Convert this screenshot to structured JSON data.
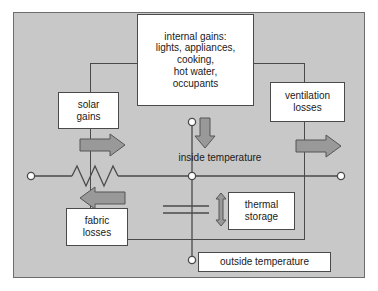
{
  "diagram": {
    "colors": {
      "frame_fill": "#c8c8c8",
      "frame_border": "#6d6d6d",
      "box_fill": "#ffffff",
      "box_border": "#4a4a4a",
      "wire": "#4a4a4a",
      "arrow_fill": "#999999",
      "arrow_border": "#555555",
      "text": "#1a1a1a"
    },
    "boxes": {
      "internal_gains": "internal gains:\nlights, appliances,\ncooking,\nhot water,\noccupants",
      "solar_gains": "solar\ngains",
      "ventilation_losses": "ventilation\nlosses",
      "fabric_losses": "fabric\nlosses",
      "thermal_storage": "thermal\nstorage",
      "outside_temperature": "outside temperature"
    },
    "labels": {
      "inside_temperature": "inside temperature"
    },
    "symbols": {
      "resistor": "resistor-zigzag",
      "capacitor": "capacitor-plates",
      "node_inside": "circuit-node",
      "node_outside": "circuit-node",
      "node_source": "circuit-node",
      "terminal_left": "circuit-terminal",
      "terminal_right": "circuit-terminal"
    },
    "arrows": {
      "solar_gains_arrow": "arrow-right",
      "ventilation_losses_arrow": "arrow-right",
      "fabric_losses_arrow": "arrow-left",
      "internal_gains_arrow": "arrow-down",
      "thermal_storage_arrow": "arrow-double-vertical"
    }
  }
}
